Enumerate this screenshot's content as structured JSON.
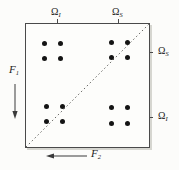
{
  "figure": {
    "labels": {
      "omega": "Ω"
    },
    "axes": {
      "f1": {
        "label": "F",
        "sub": "1",
        "direction": "down"
      },
      "f2": {
        "label": "F",
        "sub": "2",
        "direction": "left"
      }
    },
    "top_axis_ticks": [
      {
        "label": "Ω",
        "sub": "I",
        "x": 57
      },
      {
        "label": "Ω",
        "sub": "S",
        "x": 118
      }
    ],
    "right_axis_ticks": [
      {
        "label": "Ω",
        "sub": "S",
        "y": 52
      },
      {
        "label": "Ω",
        "sub": "I",
        "y": 117
      }
    ],
    "diagonal": {
      "style": "dotted",
      "from_corner": "bottom-left",
      "to_corner": "top-right"
    },
    "peak_clusters": [
      {
        "name": "cross-peak-top-left",
        "dots": [
          [
            44,
            43
          ],
          [
            60,
            43
          ],
          [
            44,
            58
          ],
          [
            60,
            58
          ]
        ]
      },
      {
        "name": "diagonal-peak-top-right",
        "dots": [
          [
            111,
            42
          ],
          [
            127,
            42
          ],
          [
            111,
            57
          ],
          [
            127,
            57
          ]
        ]
      },
      {
        "name": "diagonal-peak-bottom-left",
        "dots": [
          [
            46,
            106
          ],
          [
            62,
            106
          ],
          [
            46,
            121
          ],
          [
            62,
            121
          ]
        ]
      },
      {
        "name": "cross-peak-bottom-right",
        "dots": [
          [
            111,
            107
          ],
          [
            127,
            107
          ],
          [
            111,
            123
          ],
          [
            127,
            123
          ]
        ]
      }
    ],
    "colors": {
      "background": "#fcfcfa",
      "line": "#4a4a4a",
      "dot": "#141414"
    }
  }
}
